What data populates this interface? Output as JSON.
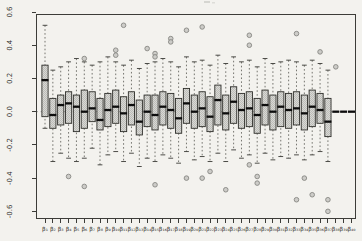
{
  "figure": {
    "background_color": "#f3f2ee",
    "plot_border_color": "#3c3c38"
  },
  "chart_data": {
    "type": "boxplot",
    "title": "",
    "xlabel": "",
    "ylabel": "",
    "grid": false,
    "legend": null,
    "ylim": [
      -0.64,
      0.585
    ],
    "yticks": [
      0.6,
      0.4,
      0.2,
      0.0,
      -0.2,
      -0.4,
      -0.6
    ],
    "ytick_labels": [
      "0.6",
      "0.4",
      "0.2",
      "0.0",
      "-0.2",
      "-0.4",
      "-0.6"
    ],
    "ytick_label_rotation_deg": -90,
    "reference_line_y": 0,
    "colors": {
      "box_fill": "#d8d8d4",
      "box_fill_checker": "#bdbdb9",
      "box_border": "#2e2e2a",
      "median": "#0c0c0c",
      "whisker": "#55554f",
      "whisker_cap": "#3a3a36",
      "outlier_stroke": "#82827e",
      "outlier_fill": "#cbcbc7",
      "reference_line": "#9a9a96",
      "axis_text": "#333330"
    },
    "categories": [
      "β₁",
      "β₂",
      "β₃",
      "β₄",
      "β₅",
      "β₆",
      "β₇",
      "β₈",
      "β₉",
      "β₁₀",
      "β₁₁",
      "β₁₂",
      "β₁₃",
      "β₁₄",
      "β₁₅",
      "β₁₆",
      "β₁₇",
      "β₁₈",
      "β₁₉",
      "β₂₀",
      "β₂₁",
      "β₂₂",
      "β₂₃",
      "β₂₄",
      "β₂₅",
      "β₂₆",
      "β₂₇",
      "β₂₈",
      "β₂₉",
      "β₃₀",
      "β₃₁",
      "β₃₂",
      "β₃₃",
      "β₃₄",
      "β₃₅",
      "β₃₆",
      "β₃₇",
      "β₃₈",
      "β₃₉",
      "β₄₀"
    ],
    "boxes": [
      {
        "q1": -0.03,
        "median": 0.19,
        "q3": 0.28,
        "whisker_low": -0.1,
        "whisker_high": 0.52,
        "outliers": []
      },
      {
        "q1": -0.1,
        "median": -0.02,
        "q3": 0.08,
        "whisker_low": -0.3,
        "whisker_high": 0.25,
        "outliers": []
      },
      {
        "q1": -0.08,
        "median": 0.04,
        "q3": 0.1,
        "whisker_low": -0.25,
        "whisker_high": 0.27,
        "outliers": []
      },
      {
        "q1": -0.07,
        "median": 0.05,
        "q3": 0.12,
        "whisker_low": -0.28,
        "whisker_high": 0.3,
        "outliers": [
          -0.39
        ]
      },
      {
        "q1": -0.12,
        "median": 0.03,
        "q3": 0.1,
        "whisker_low": -0.3,
        "whisker_high": 0.32,
        "outliers": []
      },
      {
        "q1": -0.1,
        "median": 0.0,
        "q3": 0.13,
        "whisker_low": -0.28,
        "whisker_high": 0.3,
        "outliers": [
          0.32,
          -0.45
        ]
      },
      {
        "q1": -0.06,
        "median": 0.02,
        "q3": 0.12,
        "whisker_low": -0.22,
        "whisker_high": 0.28,
        "outliers": []
      },
      {
        "q1": -0.11,
        "median": -0.05,
        "q3": 0.08,
        "whisker_low": -0.32,
        "whisker_high": 0.3,
        "outliers": []
      },
      {
        "q1": -0.09,
        "median": 0.01,
        "q3": 0.11,
        "whisker_low": -0.26,
        "whisker_high": 0.33,
        "outliers": []
      },
      {
        "q1": -0.07,
        "median": 0.03,
        "q3": 0.13,
        "whisker_low": -0.24,
        "whisker_high": 0.3,
        "outliers": [
          0.37,
          0.34
        ]
      },
      {
        "q1": -0.12,
        "median": -0.01,
        "q3": 0.09,
        "whisker_low": -0.3,
        "whisker_high": 0.28,
        "outliers": [
          0.52
        ]
      },
      {
        "q1": -0.08,
        "median": 0.04,
        "q3": 0.12,
        "whisker_low": -0.25,
        "whisker_high": 0.31,
        "outliers": []
      },
      {
        "q1": -0.14,
        "median": -0.06,
        "q3": 0.07,
        "whisker_low": -0.33,
        "whisker_high": 0.26,
        "outliers": []
      },
      {
        "q1": -0.09,
        "median": 0.0,
        "q3": 0.1,
        "whisker_low": -0.28,
        "whisker_high": 0.29,
        "outliers": [
          0.38
        ]
      },
      {
        "q1": -0.11,
        "median": -0.02,
        "q3": 0.1,
        "whisker_low": -0.3,
        "whisker_high": 0.3,
        "outliers": [
          0.35,
          0.33,
          -0.44
        ]
      },
      {
        "q1": -0.08,
        "median": 0.03,
        "q3": 0.12,
        "whisker_low": -0.26,
        "whisker_high": 0.32,
        "outliers": []
      },
      {
        "q1": -0.1,
        "median": 0.01,
        "q3": 0.11,
        "whisker_low": -0.28,
        "whisker_high": 0.3,
        "outliers": [
          0.44,
          0.42
        ]
      },
      {
        "q1": -0.13,
        "median": -0.04,
        "q3": 0.08,
        "whisker_low": -0.31,
        "whisker_high": 0.27,
        "outliers": []
      },
      {
        "q1": -0.07,
        "median": 0.05,
        "q3": 0.14,
        "whisker_low": -0.24,
        "whisker_high": 0.33,
        "outliers": [
          0.49,
          -0.4
        ]
      },
      {
        "q1": -0.1,
        "median": 0.0,
        "q3": 0.1,
        "whisker_low": -0.29,
        "whisker_high": 0.3,
        "outliers": []
      },
      {
        "q1": -0.09,
        "median": 0.02,
        "q3": 0.12,
        "whisker_low": -0.27,
        "whisker_high": 0.31,
        "outliers": [
          0.51,
          -0.4
        ]
      },
      {
        "q1": -0.12,
        "median": -0.03,
        "q3": 0.09,
        "whisker_low": -0.3,
        "whisker_high": 0.28,
        "outliers": [
          -0.36
        ]
      },
      {
        "q1": -0.08,
        "median": 0.07,
        "q3": 0.16,
        "whisker_low": -0.25,
        "whisker_high": 0.34,
        "outliers": []
      },
      {
        "q1": -0.11,
        "median": -0.01,
        "q3": 0.1,
        "whisker_low": -0.3,
        "whisker_high": 0.29,
        "outliers": [
          -0.47
        ]
      },
      {
        "q1": -0.07,
        "median": 0.06,
        "q3": 0.15,
        "whisker_low": -0.23,
        "whisker_high": 0.33,
        "outliers": []
      },
      {
        "q1": -0.1,
        "median": 0.01,
        "q3": 0.11,
        "whisker_low": -0.28,
        "whisker_high": 0.3,
        "outliers": []
      },
      {
        "q1": -0.09,
        "median": 0.02,
        "q3": 0.12,
        "whisker_low": -0.26,
        "whisker_high": 0.31,
        "outliers": [
          0.46,
          0.4,
          -0.32
        ]
      },
      {
        "q1": -0.13,
        "median": -0.02,
        "q3": 0.08,
        "whisker_low": -0.31,
        "whisker_high": 0.27,
        "outliers": [
          -0.39,
          -0.43
        ]
      },
      {
        "q1": -0.08,
        "median": 0.04,
        "q3": 0.13,
        "whisker_low": -0.25,
        "whisker_high": 0.32,
        "outliers": []
      },
      {
        "q1": -0.11,
        "median": 0.0,
        "q3": 0.1,
        "whisker_low": -0.29,
        "whisker_high": 0.29,
        "outliers": []
      },
      {
        "q1": -0.09,
        "median": 0.03,
        "q3": 0.12,
        "whisker_low": -0.27,
        "whisker_high": 0.3,
        "outliers": []
      },
      {
        "q1": -0.1,
        "median": 0.01,
        "q3": 0.11,
        "whisker_low": -0.28,
        "whisker_high": 0.31,
        "outliers": []
      },
      {
        "q1": -0.08,
        "median": 0.02,
        "q3": 0.12,
        "whisker_low": -0.26,
        "whisker_high": 0.3,
        "outliers": [
          0.47,
          -0.53
        ]
      },
      {
        "q1": -0.11,
        "median": -0.01,
        "q3": 0.1,
        "whisker_low": -0.29,
        "whisker_high": 0.28,
        "outliers": [
          -0.4
        ]
      },
      {
        "q1": -0.09,
        "median": 0.03,
        "q3": 0.13,
        "whisker_low": -0.26,
        "whisker_high": 0.31,
        "outliers": [
          -0.5
        ]
      },
      {
        "q1": -0.07,
        "median": 0.01,
        "q3": 0.11,
        "whisker_low": -0.24,
        "whisker_high": 0.29,
        "outliers": [
          0.36
        ]
      },
      {
        "q1": -0.15,
        "median": -0.06,
        "q3": 0.08,
        "whisker_low": -0.3,
        "whisker_high": 0.25,
        "outliers": [
          -0.53,
          -0.6
        ]
      },
      {
        "q1": 0.0,
        "median": 0.0,
        "q3": 0.0,
        "whisker_low": 0.0,
        "whisker_high": 0.0,
        "outliers": [
          0.27
        ]
      },
      {
        "q1": 0.0,
        "median": 0.0,
        "q3": 0.0,
        "whisker_low": 0.0,
        "whisker_high": 0.0,
        "outliers": []
      },
      {
        "q1": 0.0,
        "median": 0.0,
        "q3": 0.0,
        "whisker_low": 0.0,
        "whisker_high": 0.0,
        "outliers": []
      }
    ]
  }
}
